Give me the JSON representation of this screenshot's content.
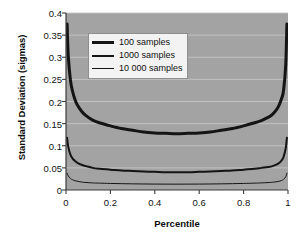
{
  "chart_data": {
    "type": "line",
    "title": "",
    "xlabel": "Percentile",
    "ylabel": "Standard Deviation (sigmas)",
    "xlim": [
      0,
      1
    ],
    "ylim": [
      0,
      0.4
    ],
    "xticks": [
      "0",
      "0.2",
      "0.4",
      "0.6",
      "0.8",
      "1"
    ],
    "xtick_values": [
      0,
      0.2,
      0.4,
      0.6,
      0.8,
      1
    ],
    "yticks": [
      "0",
      "0.05",
      "0.1",
      "0.15",
      "0.2",
      "0.25",
      "0.3",
      "0.35",
      "0.4"
    ],
    "ytick_values": [
      0,
      0.05,
      0.1,
      0.15,
      0.2,
      0.25,
      0.3,
      0.35,
      0.4
    ],
    "grid": "horizontal",
    "legend_position": "upper-left-inside",
    "plot_background": "#a3a3a3",
    "line_color": "#141414",
    "x": [
      0.005,
      0.01,
      0.02,
      0.03,
      0.04,
      0.05,
      0.07,
      0.09,
      0.12,
      0.15,
      0.2,
      0.25,
      0.3,
      0.35,
      0.4,
      0.45,
      0.5,
      0.55,
      0.6,
      0.65,
      0.7,
      0.75,
      0.8,
      0.85,
      0.88,
      0.91,
      0.93,
      0.95,
      0.96,
      0.97,
      0.98,
      0.99,
      0.995
    ],
    "series": [
      {
        "name": "100 samples",
        "line_width": 3,
        "values": [
          0.375,
          0.305,
          0.248,
          0.222,
          0.205,
          0.193,
          0.178,
          0.168,
          0.158,
          0.152,
          0.145,
          0.139,
          0.135,
          0.131,
          0.129,
          0.128,
          0.127,
          0.128,
          0.129,
          0.131,
          0.135,
          0.139,
          0.145,
          0.152,
          0.157,
          0.164,
          0.171,
          0.183,
          0.192,
          0.205,
          0.225,
          0.285,
          0.375
        ]
      },
      {
        "name": "1000 samples",
        "line_width": 2,
        "values": [
          0.118,
          0.098,
          0.08,
          0.071,
          0.066,
          0.062,
          0.057,
          0.054,
          0.05,
          0.048,
          0.046,
          0.044,
          0.043,
          0.042,
          0.041,
          0.04,
          0.04,
          0.04,
          0.041,
          0.042,
          0.043,
          0.044,
          0.046,
          0.048,
          0.05,
          0.052,
          0.054,
          0.058,
          0.061,
          0.066,
          0.075,
          0.095,
          0.118
        ]
      },
      {
        "name": "10 000 samples",
        "line_width": 1,
        "values": [
          0.038,
          0.032,
          0.026,
          0.023,
          0.021,
          0.02,
          0.018,
          0.017,
          0.016,
          0.0155,
          0.0148,
          0.0143,
          0.0139,
          0.0136,
          0.0134,
          0.0133,
          0.0132,
          0.0133,
          0.0134,
          0.0136,
          0.0139,
          0.0143,
          0.0148,
          0.0155,
          0.016,
          0.0168,
          0.0175,
          0.0188,
          0.0197,
          0.0212,
          0.024,
          0.03,
          0.038
        ]
      }
    ]
  },
  "legend": {
    "items": [
      {
        "label": "100 samples"
      },
      {
        "label": "1000 samples"
      },
      {
        "label": "10 000 samples"
      }
    ]
  }
}
